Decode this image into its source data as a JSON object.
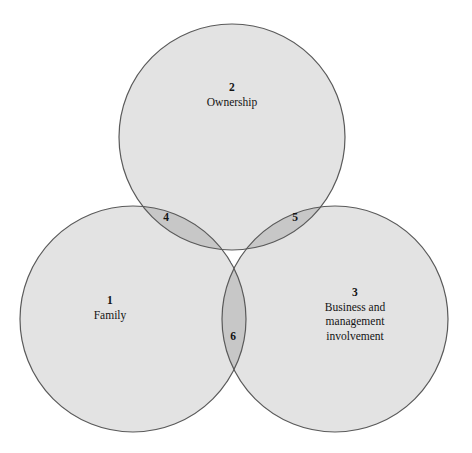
{
  "diagram": {
    "type": "venn",
    "set_count": 3,
    "background_color": "#ffffff",
    "circle_fill": "#e3e3e3",
    "circle_stroke": "#5a5a5a",
    "overlap_pair_fill": "#c7c7c7",
    "overlap_triple_fill": "#a9a9a9",
    "text_color": "#141414",
    "center_text_color": "#ffffff",
    "circles": [
      {
        "id": "family",
        "cx": 133,
        "cy": 319,
        "r": 113
      },
      {
        "id": "ownership",
        "cx": 232,
        "cy": 137,
        "r": 113
      },
      {
        "id": "business",
        "cx": 335,
        "cy": 319,
        "r": 113
      }
    ],
    "sets": [
      {
        "number": "1",
        "label_lines": [
          "Family"
        ],
        "region": "family-only"
      },
      {
        "number": "2",
        "label_lines": [
          "Ownership"
        ],
        "region": "ownership-only"
      },
      {
        "number": "3",
        "label_lines": [
          "Business and",
          "management",
          "involvement"
        ],
        "region": "business-only"
      }
    ],
    "intersections": [
      {
        "number": "4",
        "region": "family-ownership",
        "on_dark": false
      },
      {
        "number": "5",
        "region": "ownership-business",
        "on_dark": false
      },
      {
        "number": "6",
        "region": "family-business",
        "on_dark": false
      },
      {
        "number": "7",
        "region": "family-ownership-business",
        "on_dark": true
      }
    ]
  }
}
